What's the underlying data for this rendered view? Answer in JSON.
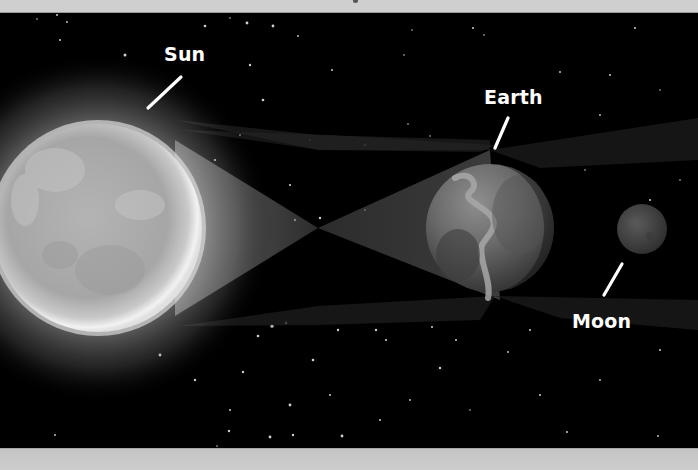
{
  "diagram": {
    "type": "astronomy-illustration",
    "labels": {
      "sun": "Sun",
      "earth": "Earth",
      "moon": "Moon"
    },
    "colors": {
      "background": "#000000",
      "frame_band": "#cfcfcf",
      "label_text": "#ffffff",
      "pointer_line": "#ffffff",
      "sun_core": "#a9a9a9",
      "sun_glow": "#e6e6e6",
      "earth": "#6a6a6a",
      "moon": "#4a4a4a",
      "ray_fill": "#3a3a3a"
    },
    "bodies": [
      {
        "name": "Sun",
        "cx": 98,
        "cy": 228,
        "r": 104
      },
      {
        "name": "Earth",
        "cx": 490,
        "cy": 228,
        "r": 64
      },
      {
        "name": "Moon",
        "cx": 642,
        "cy": 229,
        "r": 25
      }
    ],
    "pointers": [
      {
        "for": "Sun",
        "x1": 181,
        "y1": 77,
        "x2": 148,
        "y2": 108
      },
      {
        "for": "Earth",
        "x1": 508,
        "y1": 118,
        "x2": 495,
        "y2": 148
      },
      {
        "for": "Moon",
        "x1": 622,
        "y1": 264,
        "x2": 604,
        "y2": 295
      }
    ],
    "ray_crossing_point": {
      "x": 318,
      "y": 228
    }
  }
}
